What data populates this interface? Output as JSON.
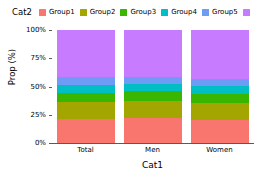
{
  "chart_data": {
    "type": "bar",
    "subtype": "stacked-100-percent",
    "title": "",
    "xlabel": "Cat1",
    "ylabel": "Prop (%)",
    "categories": [
      "Total",
      "Men",
      "Women"
    ],
    "ylim": [
      0,
      100
    ],
    "ytick_labels": [
      "0%",
      "25%",
      "50%",
      "75%",
      "100%"
    ],
    "ytick_values": [
      0,
      25,
      50,
      75,
      100
    ],
    "grid": false,
    "legend_title": "Cat2",
    "legend_position": "top",
    "series": [
      {
        "name": "Group1",
        "color": "#f8766d",
        "values": [
          21,
          22,
          20
        ]
      },
      {
        "name": "Group2",
        "color": "#a3a500",
        "values": [
          15,
          15,
          15
        ]
      },
      {
        "name": "Group3",
        "color": "#39b600",
        "values": [
          8,
          9,
          8
        ]
      },
      {
        "name": "Group4",
        "color": "#00bfc4",
        "values": [
          7,
          6,
          7
        ]
      },
      {
        "name": "Group5",
        "color": "#6e9bf4",
        "values": [
          7,
          6,
          7
        ]
      },
      {
        "name": "Group6",
        "color": "#c77cff",
        "values": [
          42,
          42,
          43
        ]
      }
    ]
  },
  "legend": {
    "title": "Cat2",
    "items": [
      {
        "label": "Group1",
        "color": "#f8766d"
      },
      {
        "label": "Group2",
        "color": "#a3a500"
      },
      {
        "label": "Group3",
        "color": "#39b600"
      },
      {
        "label": "Group4",
        "color": "#00bfc4"
      },
      {
        "label": "Group5",
        "color": "#6e9bf4"
      },
      {
        "label": "Group6",
        "color": "#c77cff"
      }
    ]
  },
  "axes": {
    "y_title": "Prop (%)",
    "x_title": "Cat1",
    "y_ticks": [
      "100%",
      "75%",
      "50%",
      "25%",
      "0%"
    ],
    "x_ticks": [
      "Total",
      "Men",
      "Women"
    ]
  },
  "colors": {
    "axis": "#5a5a5a",
    "text": "#000000",
    "background": "#ffffff"
  }
}
